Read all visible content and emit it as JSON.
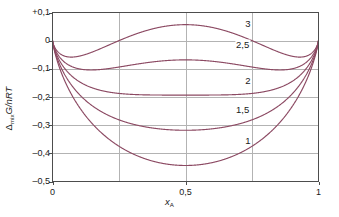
{
  "chart_data": {
    "type": "line",
    "title": "",
    "subtitle": "",
    "xlabel": "x_A",
    "xlabel_main": "x",
    "xlabel_sub": "A",
    "ylabel": "Δ_mix G/nRT",
    "ylabel_delta": "Δ",
    "ylabel_delta_sub": "mix",
    "ylabel_rest": "G/nRT",
    "xlim": [
      0,
      1
    ],
    "ylim": [
      -0.5,
      0.1
    ],
    "grid": true,
    "grid_x": [
      0.25,
      0.5,
      0.75
    ],
    "grid_y": [
      0.1,
      0,
      -0.1,
      -0.2,
      -0.3,
      -0.4,
      -0.5
    ],
    "legend_position": "inline-right",
    "xticks": [
      0,
      0.5,
      1
    ],
    "xtick_labels": [
      "0",
      "0,5",
      "1"
    ],
    "yticks": [
      0.1,
      0,
      -0.1,
      -0.2,
      -0.3,
      -0.4,
      -0.5
    ],
    "ytick_labels": [
      "+0,1",
      "0",
      "–0,1",
      "–0,2",
      "–0,3",
      "–0,4",
      "–0,5"
    ],
    "curve_color": "#8c4a63",
    "axis_color": "#4d4d4d",
    "grid_color": "#b3b3b3",
    "series": [
      {
        "name": "3",
        "xi": 3,
        "label": "3",
        "label_x": 0.735,
        "label_y": 0.063,
        "min_value": -0.049,
        "center_value": 0.057
      },
      {
        "name": "2,5",
        "xi": 2.5,
        "label": "2,5",
        "label_x": 0.715,
        "label_y": -0.013,
        "min_value": -0.106,
        "center_value": -0.068
      },
      {
        "name": "2",
        "xi": 2,
        "label": "2",
        "label_x": 0.735,
        "label_y": -0.141,
        "min_value": -0.193,
        "center_value": -0.193
      },
      {
        "name": "1,5",
        "xi": 1.5,
        "label": "1,5",
        "label_x": 0.715,
        "label_y": -0.244,
        "min_value": -0.318,
        "center_value": -0.318
      },
      {
        "name": "1",
        "xi": 1,
        "label": "1",
        "label_x": 0.735,
        "label_y": -0.352,
        "min_value": -0.443,
        "center_value": -0.443
      }
    ],
    "equation": "x ln x + (1-x) ln(1-x) + xi*x*(1-x)"
  }
}
